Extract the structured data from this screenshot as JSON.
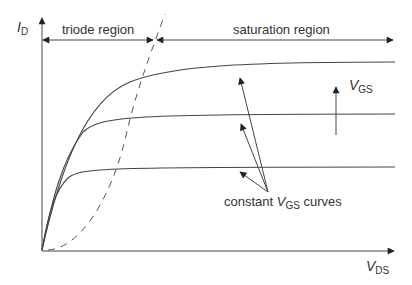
{
  "diagram": {
    "y_axis": {
      "symbol": "I",
      "subscript": "D"
    },
    "x_axis": {
      "symbol": "V",
      "subscript": "DS"
    },
    "regions": {
      "triode": "triode region",
      "saturation": "saturation region"
    },
    "vgs_arrow": {
      "symbol": "V",
      "subscript": "GS"
    },
    "curves_label": {
      "prefix": "constant ",
      "symbol": "V",
      "subscript": "GS",
      "suffix": " curves"
    },
    "curves": [
      {
        "name": "low VGS",
        "plateau_y": 167
      },
      {
        "name": "mid VGS",
        "plateau_y": 114
      },
      {
        "name": "high VGS",
        "plateau_y": 62
      }
    ],
    "colors": {
      "line": "#333333",
      "background": "#ffffff"
    }
  }
}
